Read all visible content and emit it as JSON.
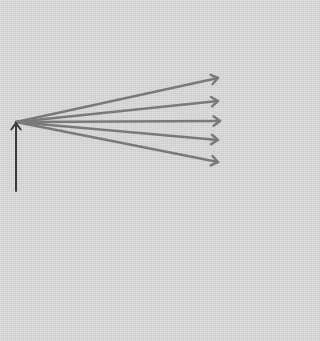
{
  "diagram": {
    "background": "#d9d9d9",
    "origin": {
      "x": 16,
      "y": 122
    },
    "vertical_arrow": {
      "color": "#3a3a3a",
      "from": {
        "x": 16,
        "y": 191
      },
      "to": {
        "x": 16,
        "y": 123
      },
      "stroke_width": 2
    },
    "fan_arrows": {
      "color": "#7a7a7a",
      "stroke_width": 2.5,
      "tips": [
        {
          "x": 218,
          "y": 78
        },
        {
          "x": 218,
          "y": 101
        },
        {
          "x": 220,
          "y": 121
        },
        {
          "x": 218,
          "y": 140
        },
        {
          "x": 218,
          "y": 162
        }
      ]
    }
  }
}
